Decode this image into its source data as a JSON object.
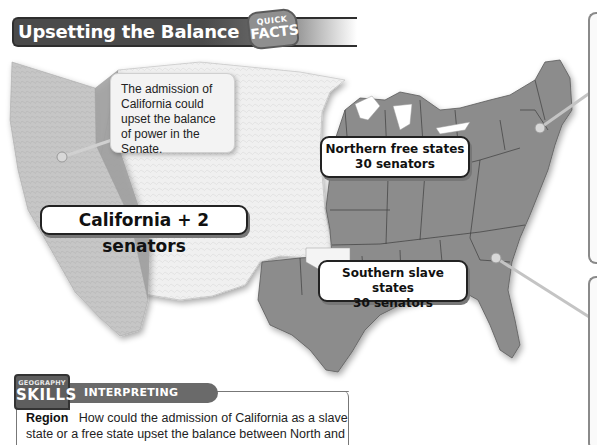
{
  "header": {
    "title": "Upsetting the Balance",
    "badge_top": "QUICK",
    "badge_bottom": "FACTS"
  },
  "map": {
    "regions": [
      {
        "name": "California",
        "shade": "light gray relief",
        "status": "proposed new state"
      },
      {
        "name": "Western territories",
        "shade": "white relief"
      },
      {
        "name": "Northern free states",
        "shade": "medium gray"
      },
      {
        "name": "Southern slave states",
        "shade": "medium gray"
      }
    ],
    "colors": {
      "states": "#8c8c8c",
      "territories": "#f2f2f2",
      "california": "#c4c4c4",
      "state_borders": "#444444",
      "leader_lines": "#bdbdbd"
    },
    "note": "The admission of California could upset the balance of power in the Senate.",
    "labels": {
      "california": "California + 2 senators",
      "north_line1": "Northern free states",
      "north_line2": "30 senators",
      "south_line1": "Southern slave states",
      "south_line2": "30 senators"
    }
  },
  "skills": {
    "badge_small": "GEOGRAPHY",
    "badge_big": "SKILLS",
    "tab_label": "INTERPRETING MAPS",
    "question_label": "Region",
    "question_text": "How could the admission of California as a slave state or a free state upset the balance between North and South?"
  }
}
